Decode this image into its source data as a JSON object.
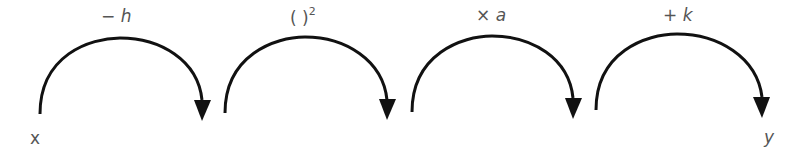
{
  "diagram": {
    "type": "function-transformation-flow",
    "input_label": "x",
    "output_label": "y",
    "steps": [
      {
        "op": "−",
        "var": "h",
        "text": "− h"
      },
      {
        "op": "( )",
        "var": "2",
        "text": "( )²"
      },
      {
        "op": "×",
        "var": "a",
        "text": "× a"
      },
      {
        "op": "+",
        "var": "k",
        "text": "+ k"
      }
    ],
    "colors": {
      "arrow": "#111111",
      "text": "#555555",
      "background": "#ffffff"
    }
  }
}
